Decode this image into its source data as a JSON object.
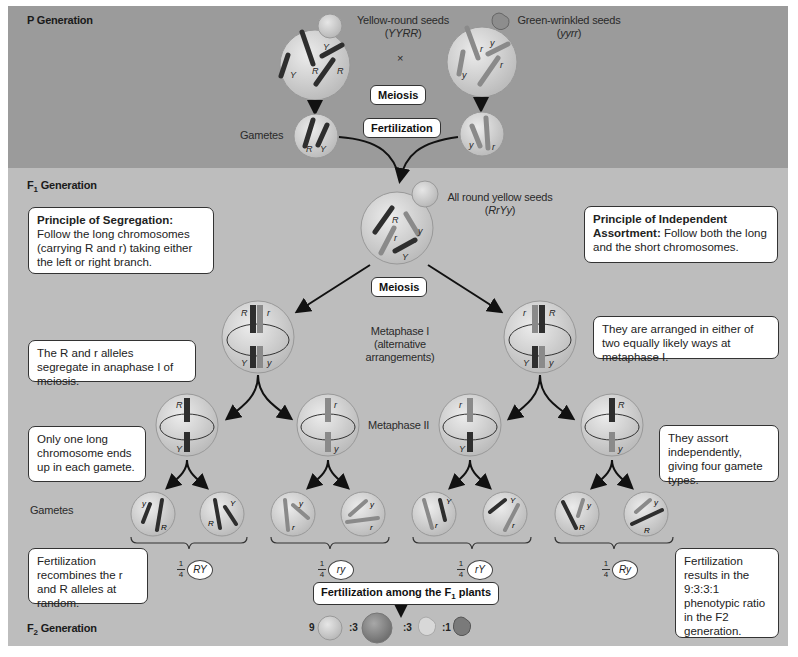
{
  "generations": {
    "p": "P Generation",
    "f1_prefix": "F",
    "f1_sub": "1",
    "f1_suffix": " Generation",
    "f2_prefix": "F",
    "f2_sub": "2",
    "f2_suffix": " Generation"
  },
  "p_generation": {
    "parent1": {
      "label": "Yellow-round seeds",
      "genotype": "YYRR"
    },
    "parent2": {
      "label": "Green-wrinkled seeds",
      "genotype": "yyrr"
    },
    "cross_symbol": "×",
    "gametes_label": "Gametes",
    "meiosis_label": "Meiosis",
    "fertilization_label": "Fertilization"
  },
  "f1_generation": {
    "label": "All round yellow seeds",
    "genotype": "RrYy",
    "meiosis_label": "Meiosis",
    "metaphase1_label": "Metaphase I",
    "metaphase1_sub1": "(alternative",
    "metaphase1_sub2": "arrangements)",
    "metaphase2_label": "Metaphase II",
    "gametes_label": "Gametes"
  },
  "notes": {
    "segregation_title": "Principle of Segregation:",
    "segregation_text": " Follow the long chromosomes (carrying R and r) taking either the left or right branch.",
    "independent_title": "Principle of Independent Assortment:",
    "independent_text": "  Follow both the long and the short chromosomes.",
    "anaphase": "The R and r alleles segregate in anaphase I of meiosis.",
    "arranged": "They are arranged in either of two equally likely ways at metaphase I.",
    "one_long": "Only one long chromosome ends up in each gamete.",
    "assort": "They assort independently, giving four gamete types.",
    "recombine": "Fertilization recombines the r and R alleles at random.",
    "ratio_note": "Fertilization results in the 9:3:3:1 phenotypic ratio in the F2 generation."
  },
  "gamete_types": [
    {
      "fraction_num": "1",
      "fraction_den": "4",
      "genotype": "RY"
    },
    {
      "fraction_num": "1",
      "fraction_den": "4",
      "genotype": "ry"
    },
    {
      "fraction_num": "1",
      "fraction_den": "4",
      "genotype": "rY"
    },
    {
      "fraction_num": "1",
      "fraction_den": "4",
      "genotype": "Ry"
    }
  ],
  "f2": {
    "fertilization_label_prefix": "Fertilization among the F",
    "fertilization_label_sub": "1",
    "fertilization_label_suffix": " plants",
    "ratios": [
      "9",
      ":3",
      ":3",
      ":1"
    ],
    "phenotypes": [
      "yellow-round",
      "green-round",
      "yellow-wrinkled",
      "green-wrinkled"
    ]
  },
  "colors": {
    "p_band": "#9b9b9b",
    "f_band": "#bdbdbd",
    "dark_chromosome": "#2e2e2e",
    "light_chromosome": "#8a8a8a",
    "cell_fill": "#d2d2d2"
  }
}
